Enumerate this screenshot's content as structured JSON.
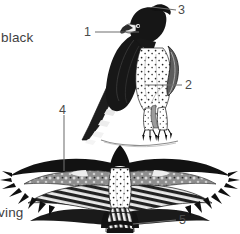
{
  "figure": {
    "kind": "bird-identification-plate",
    "background_color": "#ffffff",
    "ink_color": "#1a1a1a",
    "text_color": "#3f3f3f",
    "leader_line_color": "#6a6a6a"
  },
  "side_labels": [
    {
      "id": "black-label",
      "text": "black",
      "clipped": true
    },
    {
      "id": "wing-label",
      "text": "ving",
      "clipped": true
    }
  ],
  "callouts": [
    {
      "id": "callout-1",
      "number": "1",
      "target": "perched-bird-breast-upper"
    },
    {
      "id": "callout-2",
      "number": "2",
      "target": "perched-bird-flank-thigh"
    },
    {
      "id": "callout-3",
      "number": "3",
      "target": "perched-bird-crest"
    },
    {
      "id": "callout-4",
      "number": "4",
      "target": "flying-bird-wing-coverts"
    },
    {
      "id": "callout-5",
      "number": "5",
      "target": "flying-bird-tail-band"
    }
  ],
  "subjects": [
    {
      "id": "perched-bird",
      "pose": "perched",
      "view": "left profile",
      "parts": [
        "crest",
        "hooked bill",
        "dark mantle",
        "barred wing",
        "spotted underparts",
        "feathered tarsi",
        "talons",
        "perch branch"
      ]
    },
    {
      "id": "flying-bird",
      "pose": "flying",
      "view": "underside / ventral",
      "parts": [
        "dark head",
        "spotted white body",
        "broad barred wings",
        "fingered primaries",
        "banded tail"
      ]
    }
  ]
}
